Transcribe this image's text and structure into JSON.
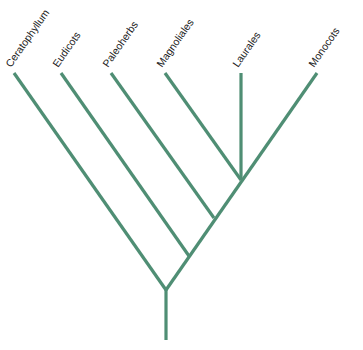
{
  "diagram": {
    "type": "phylogenetic-tree",
    "line_color": "#4f8e74",
    "label_color": "#222222",
    "taxa": [
      {
        "label": "Ceratophyllum",
        "tip": [
          14,
          73
        ],
        "join": [
          166,
          290
        ]
      },
      {
        "label": "Eudicots",
        "tip": [
          61,
          73
        ],
        "join": [
          189,
          256
        ]
      },
      {
        "label": "Paleoherbs",
        "tip": [
          111,
          73
        ],
        "join": [
          214,
          218
        ]
      },
      {
        "label": "Magnoliales",
        "tip": [
          165,
          73
        ],
        "join": [
          241,
          180
        ]
      },
      {
        "label": "Laurales",
        "tip": [
          241,
          73
        ],
        "join": [
          241,
          180
        ]
      },
      {
        "label": "Monocots",
        "tip": [
          317,
          73
        ],
        "join": [
          241,
          180
        ]
      }
    ],
    "root": {
      "base": [
        166,
        340
      ],
      "node": [
        166,
        290
      ]
    }
  }
}
